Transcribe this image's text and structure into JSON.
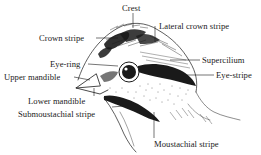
{
  "diagram": {
    "colors": {
      "ink": "#1a1a1a",
      "background": "#ffffff"
    },
    "labels": {
      "crest": "Crest",
      "crown_stripe": "Crown stripe",
      "lateral_crown_stripe": "Lateral crown stripe",
      "eye_ring": "Eye-ring",
      "supercilium": "Supercilium",
      "upper_mandible": "Upper mandible",
      "eye_stripe": "Eye-stripe",
      "lower_mandible": "Lower mandible",
      "submoustachial_stripe": "Submoustachial stripe",
      "moustachial_stripe": "Moustachial stripe"
    }
  }
}
